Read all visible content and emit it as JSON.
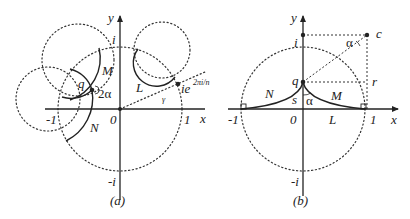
{
  "figure": {
    "panel_a": {
      "caption": "(a)",
      "axis_labels": {
        "x": "x",
        "y": "y"
      },
      "ticks": {
        "i": "i",
        "neg_i": "-i",
        "one": "1",
        "neg_one": "-1",
        "zero": "0"
      },
      "arc_labels": {
        "M": "M",
        "N": "N",
        "L": "L"
      },
      "point_q": "q",
      "angle_label": "2α",
      "point_label_base": "ie",
      "point_label_exp": "2πi/n",
      "small_angle_label": "γ"
    },
    "panel_b": {
      "caption": "(b)",
      "axis_labels": {
        "x": "x",
        "y": "y"
      },
      "ticks": {
        "i": "i",
        "neg_i": "-i",
        "one": "1",
        "neg_one": "-1",
        "zero": "0"
      },
      "arc_labels": {
        "M": "M",
        "N": "N",
        "L": "L"
      },
      "point_q": "q",
      "point_c": "c",
      "segment_r": "r",
      "segment_s": "s",
      "angle_alpha_bottom": "α",
      "angle_alpha_top": "α"
    }
  }
}
